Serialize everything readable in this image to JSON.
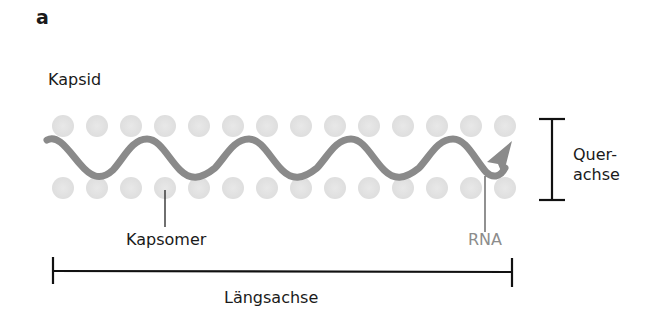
{
  "panel_label": "a",
  "labels": {
    "capsid": "Kapsid",
    "capsomer": "Kapsomer",
    "rna": "RNA",
    "transverse_axis_line1": "Quer-",
    "transverse_axis_line2": "achse",
    "longitudinal_axis": "Längsachse"
  },
  "colors": {
    "capsomer_fill": "#e3e3e3",
    "rna_stroke": "#8a8a8a",
    "axis_stroke": "#111111",
    "rna_label": "#8c8c8c"
  },
  "capsomer_rows": {
    "count_per_row": 14,
    "top_row_y": 126,
    "bottom_row_y": 188
  }
}
